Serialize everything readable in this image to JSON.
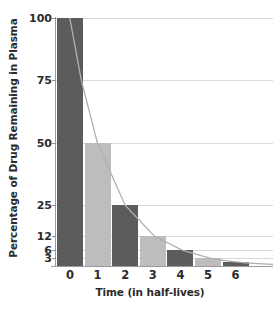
{
  "chart_data": {
    "type": "bar",
    "title": "",
    "xlabel": "Time (in half-lives)",
    "ylabel": "Percentage of Drug Remaining in Plasma",
    "categories": [
      "0",
      "1",
      "2",
      "3",
      "4",
      "5",
      "6"
    ],
    "values": [
      100,
      50,
      25,
      12,
      6,
      3,
      1.5
    ],
    "bar_colors": [
      "#5c5c5c",
      "#bdbdbd",
      "#5c5c5c",
      "#bdbdbd",
      "#5c5c5c",
      "#bdbdbd",
      "#5c5c5c"
    ],
    "y_ticks": [
      {
        "label": "100",
        "value": 100
      },
      {
        "label": "75",
        "value": 75
      },
      {
        "label": "50",
        "value": 50
      },
      {
        "label": "25",
        "value": 25
      },
      {
        "label": "12",
        "value": 12
      },
      {
        "label": "6",
        "value": 6
      },
      {
        "label": "3",
        "value": 3
      }
    ],
    "x_ticks": [
      "0",
      "1",
      "2",
      "3",
      "4",
      "5",
      "6"
    ],
    "ylim": [
      0,
      100
    ],
    "xlim": [
      0,
      7
    ],
    "grid": true,
    "legend": "none",
    "overlay_curve": {
      "name": "exponential-decay",
      "color": "#b0b0b0",
      "expression": "100 * 0.5^t"
    },
    "colors": {
      "bar_dark": "#5c5c5c",
      "bar_light": "#bdbdbd",
      "gridline": "#d9d9d9",
      "axis": "#9a9a9a",
      "text": "#2b2b2b",
      "background": "#ffffff"
    }
  }
}
